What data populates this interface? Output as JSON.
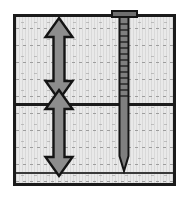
{
  "diagram": {
    "type": "geotechnical-cross-section",
    "colors": {
      "page_background": "#ffffff",
      "soil_fill": "#e9e9e9",
      "soil_stipple": "#5f5f5f",
      "frame_outline": "#1b1b1b",
      "arrow_fill": "#8d8d8d",
      "arrow_outline": "#141414",
      "pile_fill": "#7f7f7f",
      "pile_outline": "#141414",
      "layer_boundary": "#1b1b1b"
    },
    "frame": {
      "label": "soil-mass-boundary",
      "x": 13,
      "y": 14,
      "width": 163,
      "height": 172,
      "border_width": 3
    },
    "layers": [
      {
        "name": "upper-soil-layer",
        "label": "",
        "top": 0,
        "bottom": 86,
        "hatch": "stippled-horizontal-dashes"
      },
      {
        "name": "lower-soil-layer",
        "label": "",
        "top": 89,
        "bottom": 166,
        "hatch": "stippled-horizontal-dashes"
      },
      {
        "name": "basal-soil-strip",
        "label": "",
        "top": 157,
        "bottom": 166,
        "hatch": "stippled-horizontal-dashes"
      }
    ],
    "boundaries": [
      {
        "name": "upper-lower-interface",
        "y": 86,
        "thickness": 3,
        "color": "#1b1b1b"
      },
      {
        "name": "basal-interface",
        "y": 155,
        "thickness": 2,
        "color": "#3a3a3a"
      }
    ],
    "arrows": [
      {
        "name": "upper-layer-thickness-arrow",
        "label": "",
        "style": "double-headed-vertical",
        "x_center": 59,
        "y_top": 18,
        "y_bottom": 100,
        "shaft_width": 11,
        "head_width": 27,
        "head_length": 19,
        "measures": "upper-soil-layer thickness"
      },
      {
        "name": "lower-layer-thickness-arrow",
        "label": "",
        "style": "double-headed-vertical",
        "x_center": 59,
        "y_top": 90,
        "y_bottom": 176,
        "shaft_width": 11,
        "head_width": 27,
        "head_length": 19,
        "measures": "lower-soil-layer thickness"
      }
    ],
    "pile": {
      "name": "driven-pile",
      "label": "",
      "cap": {
        "name": "pile-cap",
        "x": 112,
        "y": 11,
        "width": 25,
        "height": 6
      },
      "shaft": {
        "name": "pile-shaft",
        "x_center": 124,
        "width": 9,
        "y_top": 16,
        "y_tip_start": 156,
        "y_tip_end": 171
      },
      "tip": {
        "name": "pile-point-tip",
        "shape": "conical-point"
      },
      "graduations": {
        "name": "pile-depth-graduations",
        "count": 13,
        "y_start": 24,
        "y_spacing": 6,
        "side": "both"
      },
      "embedded_through": [
        "upper-soil-layer",
        "lower-soil-layer"
      ]
    }
  }
}
